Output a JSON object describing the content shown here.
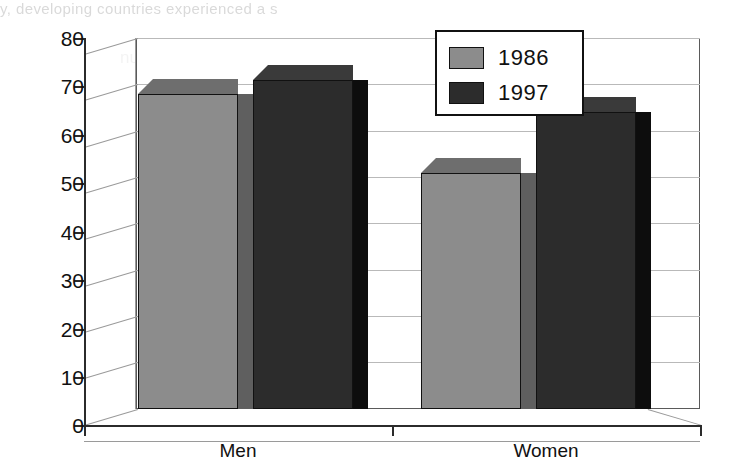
{
  "page_bleed": {
    "top_fragment": "y, developing countries experienced a s",
    "ghost_text": "number than in 1986  ·  proportion in developed"
  },
  "chart_data": {
    "type": "bar",
    "title": "",
    "subtitle": "",
    "xlabel": "",
    "ylabel": "",
    "categories": [
      "Men",
      "Women"
    ],
    "series": [
      {
        "name": "1986",
        "values": [
          68,
          51
        ],
        "color": "#8c8c8c"
      },
      {
        "name": "1997",
        "values": [
          71,
          64
        ],
        "color": "#2c2c2c"
      }
    ],
    "ylim": [
      0,
      80
    ],
    "ytick_step": 10,
    "ytick_labels": [
      "0",
      "10",
      "20",
      "30",
      "40",
      "50",
      "60",
      "70",
      "80"
    ],
    "grid": true,
    "style": "3d-clustered-column",
    "legend": {
      "position": "top-right",
      "entries": [
        "1986",
        "1997"
      ]
    },
    "annotations": []
  },
  "legend": {
    "entries": [
      {
        "label": "1986",
        "swatch": "light-gray"
      },
      {
        "label": "1997",
        "swatch": "dark-gray"
      }
    ]
  },
  "axes": {
    "y_labels": [
      "80",
      "70",
      "60",
      "50",
      "40",
      "30",
      "20",
      "10",
      "0"
    ],
    "x_labels": [
      "Men",
      "Women"
    ]
  }
}
